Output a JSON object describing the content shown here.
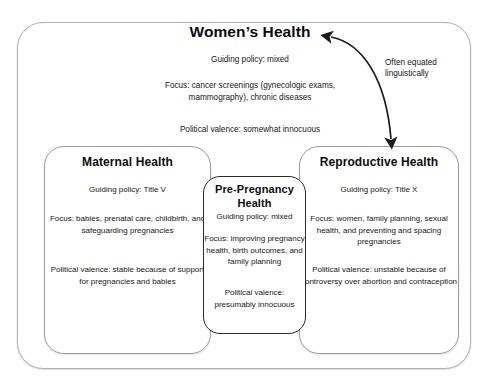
{
  "diagram": {
    "outer": {
      "title": "Women’s Health",
      "policy": "Guiding policy: mixed",
      "focus": "Focus: cancer screenings (gynecologic exams, mammography), chronic diseases",
      "valence": "Political valence: somewhat innocuous"
    },
    "annotation": {
      "label": "Often equated linguistically",
      "arrow_type": "double-headed-curved-arrow"
    },
    "boxes": [
      {
        "id": "maternal-health",
        "title": "Maternal Health",
        "policy": "Guiding policy: Title V",
        "focus": "Focus: babies, prenatal care, childbirth, and safeguarding pregnancies",
        "valence": "Political valence: stable because of support for pregnancies and babies"
      },
      {
        "id": "pre-pregnancy-health",
        "title": "Pre-Pregnancy Health",
        "policy": "Guiding policy: mixed",
        "focus": "Focus: improving pregnancy health, birth outcomes, and family planning",
        "valence": "Political valence: presumably innocuous"
      },
      {
        "id": "reproductive-health",
        "title": "Reproductive Health",
        "policy": "Guiding policy: Title X",
        "focus": "Focus: women, family planning, sexual health, and preventing and spacing pregnancies",
        "valence": "Political valence: unstable because of controversy over abortion and contraception"
      }
    ],
    "colors": {
      "background": "#ffffff",
      "text": "#161616",
      "border_light": "#9a9a9a",
      "border_strong": "#2b2b2b",
      "arrow": "#1a1a1a"
    }
  }
}
